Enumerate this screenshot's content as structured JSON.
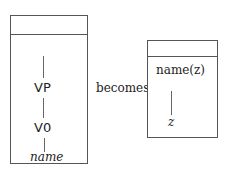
{
  "left_drs": {
    "nodes": [
      "VP",
      "V0"
    ],
    "leaf": "name"
  },
  "connector": "becomes",
  "right_drs": {
    "condition": "name(z)",
    "leaf": "z"
  }
}
